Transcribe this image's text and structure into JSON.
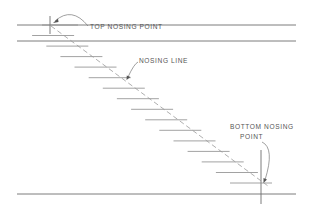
{
  "diagram": {
    "labels": {
      "top_nosing_point": "TOP NOSING POINT",
      "nosing_line": "NOSING LINE",
      "bottom_nosing_line1": "BOTTOM NOSING",
      "bottom_nosing_line2": "POINT"
    },
    "tread_count": 15,
    "colors": {
      "line": "#6d6d6d",
      "tread": "#8a8a8a",
      "nosing_line": "#9a9a9a",
      "text": "#555555"
    }
  }
}
